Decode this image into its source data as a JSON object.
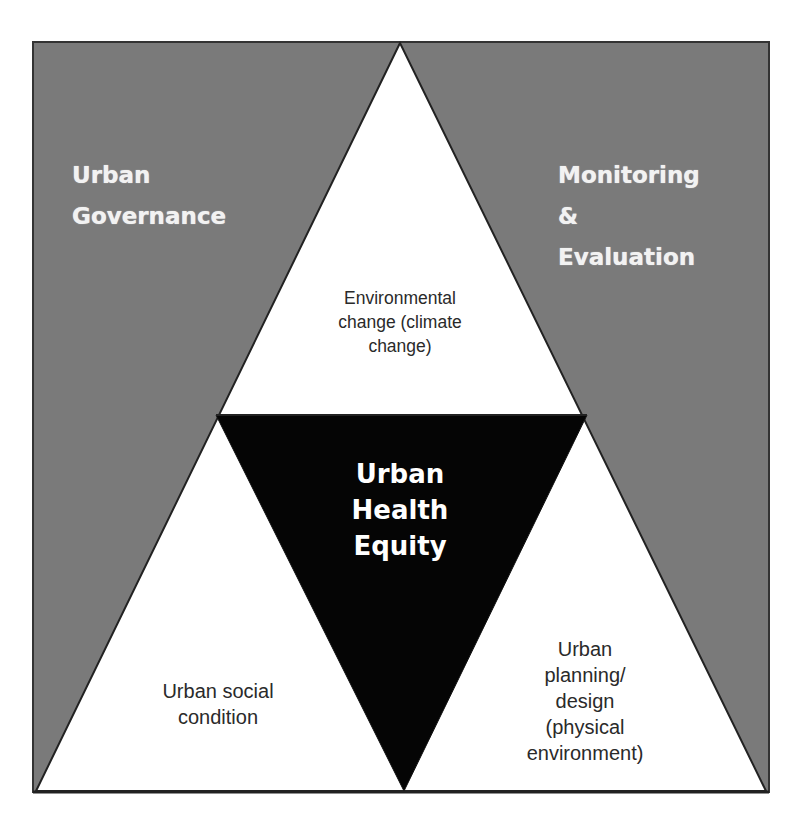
{
  "diagram": {
    "colors": {
      "background": "#ffffff",
      "corner_fill": "#7a7a7a",
      "triangle_fill": "#ffffff",
      "center_fill": "#050505",
      "stroke": "#222222",
      "corner_text": "#f2f2f2",
      "inner_text": "#2a2a2a",
      "center_text": "#ffffff"
    },
    "corners": {
      "top_left": "Urban\nGovernance",
      "top_right": "Monitoring\n&\nEvaluation"
    },
    "triangles": {
      "top": "Environmental\nchange (climate\nchange)",
      "bottom_left": "Urban social\ncondition",
      "bottom_right": "Urban\nplanning/\ndesign\n(physical\nenvironment)"
    },
    "center": "Urban\nHealth\nEquity"
  }
}
